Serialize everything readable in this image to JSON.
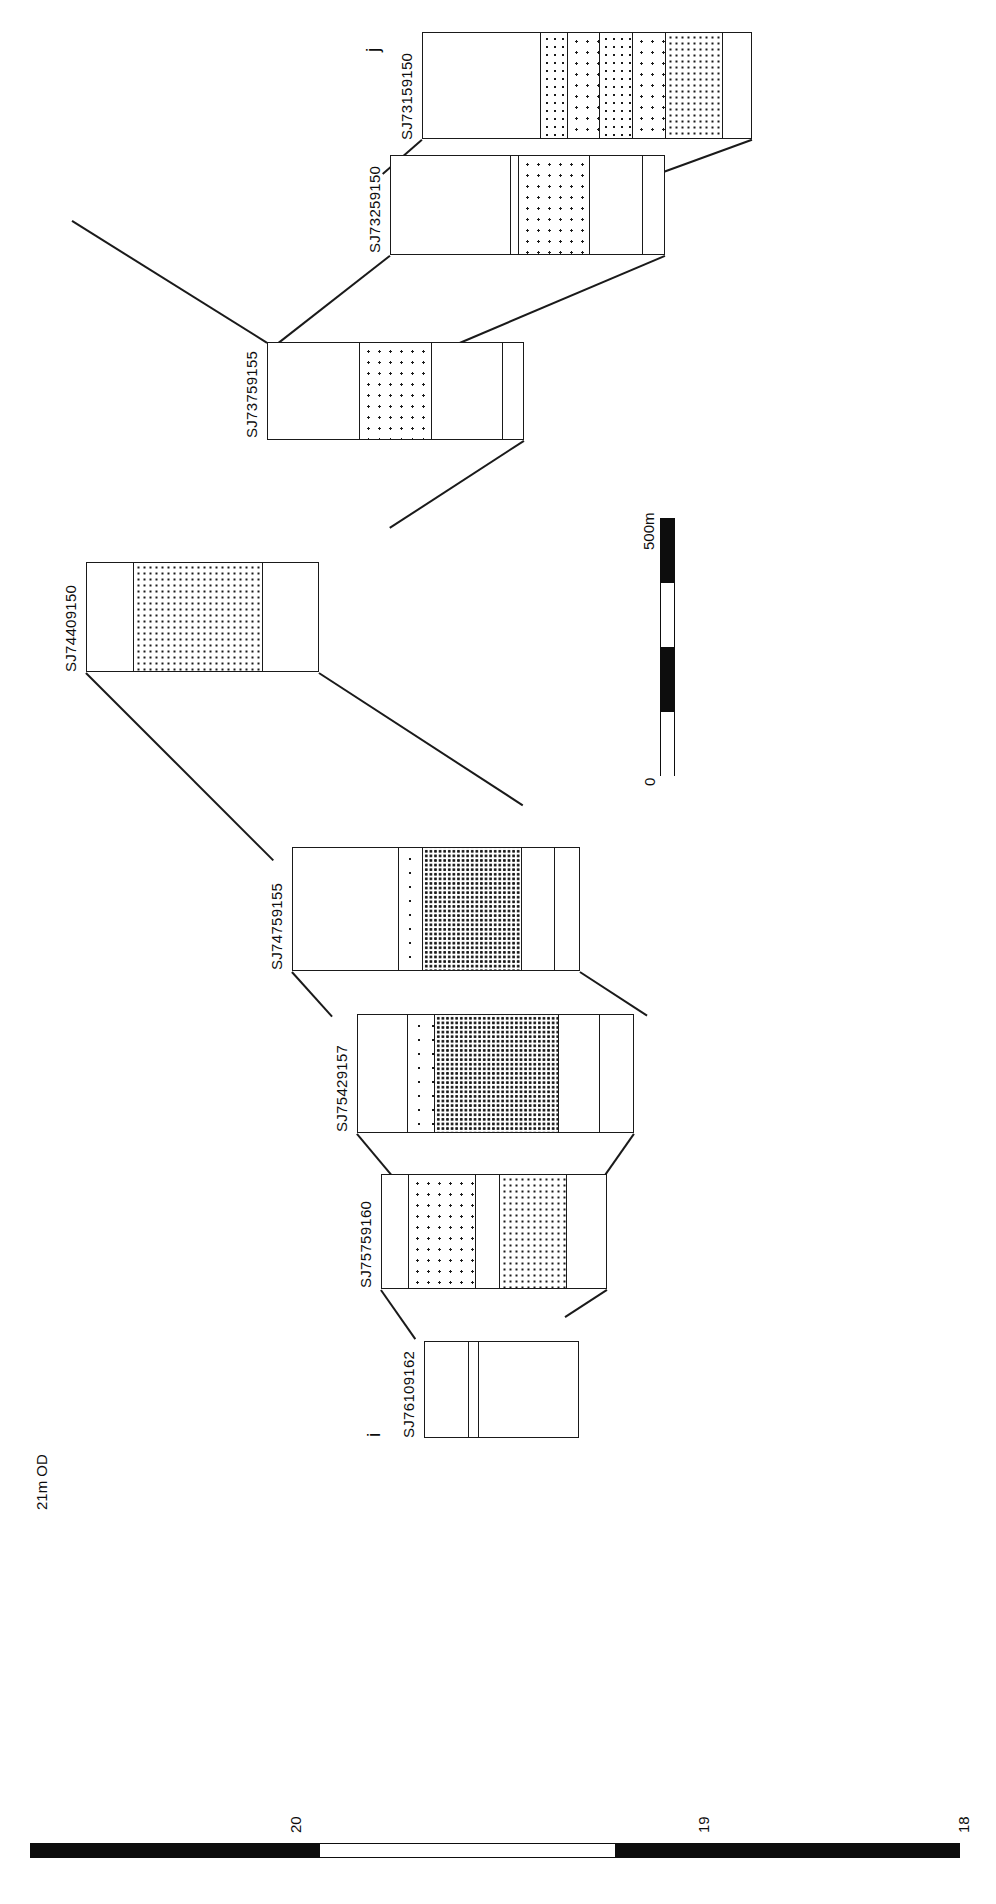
{
  "figure": {
    "type": "geological-cross-section",
    "orientation": "rotated-90-ccw",
    "section_start_marker": "i",
    "section_end_marker": "j"
  },
  "elevation_axis": {
    "top_label": "21m OD",
    "ticks": [
      "20",
      "19",
      "18"
    ],
    "unit": "m OD",
    "range_top": 21,
    "range_bottom": 18
  },
  "distance_scale": {
    "max_label": "500m",
    "min_label": "0",
    "segments": 4,
    "total_m": 500
  },
  "boreholes": [
    {
      "id": "SJ76109162",
      "segments": [
        {
          "fill": "blank",
          "label": ""
        },
        {
          "fill": "blank",
          "label": ""
        },
        {
          "fill": "blank",
          "label": ""
        }
      ]
    },
    {
      "id": "SJ75759160",
      "segments": [
        {
          "fill": "blank",
          "label": ""
        },
        {
          "fill": "dot-sparse",
          "label": ""
        },
        {
          "fill": "blank",
          "label": ""
        },
        {
          "fill": "dot-dense",
          "label": ""
        },
        {
          "fill": "blank",
          "label": ""
        }
      ]
    },
    {
      "id": "SJ75429157",
      "segments": [
        {
          "fill": "blank",
          "label": ""
        },
        {
          "fill": "dot-vsparse",
          "label": ""
        },
        {
          "fill": "dot-med",
          "label": ""
        },
        {
          "fill": "dot-vdense",
          "label": ""
        },
        {
          "fill": "dark",
          "label": ""
        },
        {
          "fill": "blank",
          "label": ""
        }
      ]
    },
    {
      "id": "SJ74759155",
      "segments": [
        {
          "fill": "blank",
          "label": ""
        },
        {
          "fill": "dot-vsparse",
          "label": ""
        },
        {
          "fill": "dot-vdense",
          "label": ""
        },
        {
          "fill": "blank",
          "label": ""
        },
        {
          "fill": "blank",
          "label": ""
        }
      ]
    },
    {
      "id": "SJ74409150",
      "segments": [
        {
          "fill": "blank",
          "label": ""
        },
        {
          "fill": "dot-dense",
          "label": ""
        },
        {
          "fill": "blank",
          "label": ""
        }
      ]
    },
    {
      "id": "SJ73759155",
      "segments": [
        {
          "fill": "blank",
          "label": ""
        },
        {
          "fill": "dot-sparse",
          "label": ""
        },
        {
          "fill": "blank",
          "label": ""
        },
        {
          "fill": "blank",
          "label": ""
        }
      ]
    },
    {
      "id": "SJ73259150",
      "segments": [
        {
          "fill": "blank",
          "label": ""
        },
        {
          "fill": "dot-vsparse",
          "label": ""
        },
        {
          "fill": "dot-sparse",
          "label": ""
        },
        {
          "fill": "blank",
          "label": ""
        },
        {
          "fill": "blank",
          "label": ""
        }
      ]
    },
    {
      "id": "SJ73159150",
      "segments": [
        {
          "fill": "blank",
          "label": ""
        },
        {
          "fill": "dot-med",
          "label": ""
        },
        {
          "fill": "dot-sparse",
          "label": ""
        },
        {
          "fill": "dot-med",
          "label": ""
        },
        {
          "fill": "dot-sparse",
          "label": ""
        },
        {
          "fill": "dot-dense",
          "label": ""
        },
        {
          "fill": "blank",
          "label": ""
        }
      ]
    }
  ],
  "colors": {
    "ink": "#1a1a1a",
    "paper": "#ffffff"
  }
}
